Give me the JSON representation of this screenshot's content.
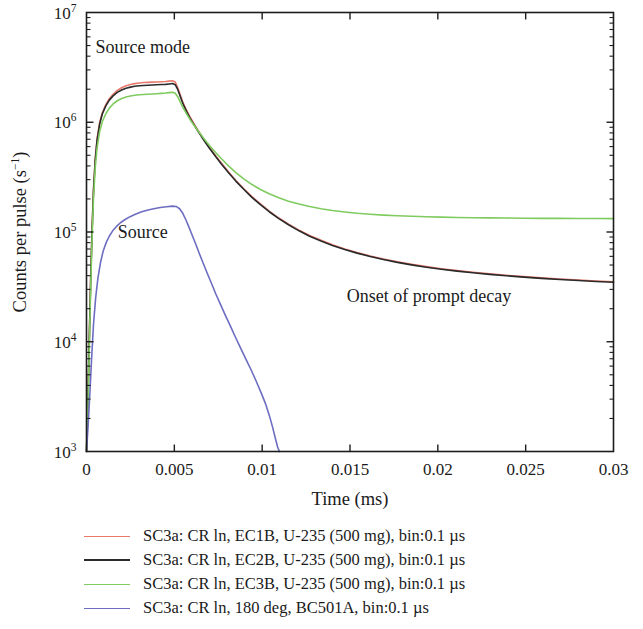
{
  "chart_data": {
    "type": "line",
    "title": "",
    "xlabel": "Time (ms)",
    "ylabel": "Counts per pulse (s−1)",
    "ylabel_parts": {
      "main": "Counts per pulse (s",
      "sup": "−1",
      "tail": ")"
    },
    "xscale": "linear",
    "yscale": "log",
    "xlim": [
      0,
      0.03
    ],
    "ylim": [
      1000,
      10000000
    ],
    "grid": false,
    "legend_position": "below-plot",
    "xticks": [
      0,
      0.005,
      0.01,
      0.015,
      0.02,
      0.025,
      0.03
    ],
    "xtick_labels": [
      "0",
      "0.005",
      "0.01",
      "0.015",
      "0.02",
      "0.025",
      "0.03"
    ],
    "yticks": [
      1000,
      10000,
      100000,
      1000000,
      10000000
    ],
    "ytick_labels": [
      "10³",
      "10⁴",
      "10⁵",
      "10⁶",
      "10⁷"
    ],
    "ytick_mantissas": [
      "10",
      "10",
      "10",
      "10",
      "10"
    ],
    "ytick_exponents": [
      "3",
      "4",
      "5",
      "6",
      "7"
    ],
    "annotations": [
      {
        "text": "Source mode",
        "x": 0.0032,
        "y": 4300000
      },
      {
        "text": "Source",
        "x": 0.0032,
        "y": 88000
      },
      {
        "text": "Onset of prompt decay",
        "x": 0.0195,
        "y": 23000
      }
    ],
    "series": [
      {
        "name": "SC3a: CR ln, EC1B, U-235 (500 mg), bin:0.1 µs",
        "color": "#e8796b",
        "points": [
          [
            0.0,
            1000
          ],
          [
            8e-05,
            3000
          ],
          [
            0.00016,
            11000
          ],
          [
            0.00024,
            40000
          ],
          [
            0.00032,
            110000
          ],
          [
            0.0004,
            250000
          ],
          [
            0.0005,
            470000
          ],
          [
            0.0006,
            700000
          ],
          [
            0.00075,
            990000
          ],
          [
            0.0009,
            1220000
          ],
          [
            0.0011,
            1450000
          ],
          [
            0.0013,
            1640000
          ],
          [
            0.0015,
            1790000
          ],
          [
            0.00175,
            1950000
          ],
          [
            0.002,
            2060000
          ],
          [
            0.00225,
            2150000
          ],
          [
            0.0025,
            2210000
          ],
          [
            0.00275,
            2250000
          ],
          [
            0.003,
            2280000
          ],
          [
            0.00325,
            2300000
          ],
          [
            0.0035,
            2310000
          ],
          [
            0.00375,
            2320000
          ],
          [
            0.004,
            2330000
          ],
          [
            0.00425,
            2340000
          ],
          [
            0.0045,
            2350000
          ],
          [
            0.0047,
            2370000
          ],
          [
            0.0049,
            2390000
          ],
          [
            0.00505,
            2330000
          ],
          [
            0.0052,
            2050000
          ],
          [
            0.00535,
            1750000
          ],
          [
            0.0055,
            1500000
          ],
          [
            0.0057,
            1280000
          ],
          [
            0.0059,
            1110000
          ],
          [
            0.00615,
            950000
          ],
          [
            0.0064,
            820000
          ],
          [
            0.0067,
            690000
          ],
          [
            0.007,
            590000
          ],
          [
            0.00735,
            495000
          ],
          [
            0.0077,
            420000
          ],
          [
            0.0081,
            350000
          ],
          [
            0.0085,
            295000
          ],
          [
            0.00895,
            248000
          ],
          [
            0.0094,
            211000
          ],
          [
            0.0099,
            180000
          ],
          [
            0.0104,
            155000
          ],
          [
            0.01095,
            134000
          ],
          [
            0.0115,
            118000
          ],
          [
            0.0121,
            104000
          ],
          [
            0.0127,
            93000
          ],
          [
            0.01335,
            84000
          ],
          [
            0.014,
            76500
          ],
          [
            0.0147,
            70000
          ],
          [
            0.0154,
            65000
          ],
          [
            0.01615,
            60500
          ],
          [
            0.0169,
            56800
          ],
          [
            0.0177,
            53500
          ],
          [
            0.0185,
            50800
          ],
          [
            0.01935,
            48400
          ],
          [
            0.0202,
            46300
          ],
          [
            0.0211,
            44500
          ],
          [
            0.022,
            43000
          ],
          [
            0.02295,
            41600
          ],
          [
            0.0239,
            40300
          ],
          [
            0.0249,
            39200
          ],
          [
            0.0259,
            38200
          ],
          [
            0.02695,
            37300
          ],
          [
            0.028,
            36500
          ],
          [
            0.029,
            35800
          ],
          [
            0.03,
            35200
          ]
        ]
      },
      {
        "name": "SC3a: CR ln, EC2B, U-235 (500 mg), bin:0.1 µs",
        "color": "#2b2b2b",
        "points": [
          [
            0.0,
            1000
          ],
          [
            8e-05,
            2800
          ],
          [
            0.00016,
            10500
          ],
          [
            0.00024,
            38000
          ],
          [
            0.00032,
            105000
          ],
          [
            0.0004,
            240000
          ],
          [
            0.0005,
            455000
          ],
          [
            0.0006,
            680000
          ],
          [
            0.00075,
            965000
          ],
          [
            0.0009,
            1190000
          ],
          [
            0.0011,
            1410000
          ],
          [
            0.0013,
            1590000
          ],
          [
            0.0015,
            1730000
          ],
          [
            0.00175,
            1870000
          ],
          [
            0.002,
            1965000
          ],
          [
            0.00225,
            2040000
          ],
          [
            0.0025,
            2090000
          ],
          [
            0.00275,
            2125000
          ],
          [
            0.003,
            2150000
          ],
          [
            0.00325,
            2165000
          ],
          [
            0.0035,
            2175000
          ],
          [
            0.00375,
            2185000
          ],
          [
            0.004,
            2195000
          ],
          [
            0.00425,
            2205000
          ],
          [
            0.0045,
            2215000
          ],
          [
            0.0047,
            2235000
          ],
          [
            0.0049,
            2255000
          ],
          [
            0.00505,
            2200000
          ],
          [
            0.0052,
            1980000
          ],
          [
            0.00535,
            1700000
          ],
          [
            0.0055,
            1460000
          ],
          [
            0.0057,
            1250000
          ],
          [
            0.0059,
            1085000
          ],
          [
            0.00615,
            930000
          ],
          [
            0.0064,
            805000
          ],
          [
            0.0067,
            678000
          ],
          [
            0.007,
            580000
          ],
          [
            0.00735,
            487000
          ],
          [
            0.0077,
            413000
          ],
          [
            0.0081,
            345000
          ],
          [
            0.0085,
            291000
          ],
          [
            0.00895,
            245000
          ],
          [
            0.0094,
            208000
          ],
          [
            0.0099,
            177500
          ],
          [
            0.0104,
            153000
          ],
          [
            0.01095,
            132500
          ],
          [
            0.0115,
            116500
          ],
          [
            0.0121,
            102500
          ],
          [
            0.0127,
            91500
          ],
          [
            0.01335,
            82800
          ],
          [
            0.014,
            75500
          ],
          [
            0.0147,
            69200
          ],
          [
            0.0154,
            64200
          ],
          [
            0.01615,
            59800
          ],
          [
            0.0169,
            56200
          ],
          [
            0.0177,
            52900
          ],
          [
            0.0185,
            50200
          ],
          [
            0.01935,
            47800
          ],
          [
            0.0202,
            45800
          ],
          [
            0.0211,
            44000
          ],
          [
            0.022,
            42500
          ],
          [
            0.02295,
            41100
          ],
          [
            0.0239,
            39900
          ],
          [
            0.0249,
            38800
          ],
          [
            0.0259,
            37800
          ],
          [
            0.02695,
            36900
          ],
          [
            0.028,
            36100
          ],
          [
            0.029,
            35400
          ],
          [
            0.03,
            34800
          ]
        ]
      },
      {
        "name": "SC3a: CR ln, EC3B, U-235 (500 mg), bin:0.1 µs",
        "color": "#7fcb5f",
        "points": [
          [
            0.0,
            1000
          ],
          [
            8e-05,
            2500
          ],
          [
            0.00016,
            9000
          ],
          [
            0.00024,
            32000
          ],
          [
            0.00032,
            90000
          ],
          [
            0.0004,
            205000
          ],
          [
            0.0005,
            390000
          ],
          [
            0.0006,
            580000
          ],
          [
            0.00075,
            825000
          ],
          [
            0.0009,
            1010000
          ],
          [
            0.0011,
            1195000
          ],
          [
            0.0013,
            1345000
          ],
          [
            0.0015,
            1460000
          ],
          [
            0.00175,
            1570000
          ],
          [
            0.002,
            1645000
          ],
          [
            0.00225,
            1700000
          ],
          [
            0.0025,
            1735000
          ],
          [
            0.00275,
            1760000
          ],
          [
            0.003,
            1778000
          ],
          [
            0.00325,
            1790000
          ],
          [
            0.0035,
            1800000
          ],
          [
            0.00375,
            1810000
          ],
          [
            0.004,
            1820000
          ],
          [
            0.00425,
            1832000
          ],
          [
            0.0045,
            1845000
          ],
          [
            0.0047,
            1862000
          ],
          [
            0.0049,
            1878000
          ],
          [
            0.00505,
            1840000
          ],
          [
            0.0052,
            1700000
          ],
          [
            0.00535,
            1520000
          ],
          [
            0.0055,
            1350000
          ],
          [
            0.0057,
            1190000
          ],
          [
            0.0059,
            1055000
          ],
          [
            0.00615,
            925000
          ],
          [
            0.0064,
            815000
          ],
          [
            0.0067,
            705000
          ],
          [
            0.007,
            615000
          ],
          [
            0.00735,
            530000
          ],
          [
            0.0077,
            462000
          ],
          [
            0.0081,
            398000
          ],
          [
            0.0085,
            348000
          ],
          [
            0.00895,
            305000
          ],
          [
            0.0094,
            272000
          ],
          [
            0.0099,
            244000
          ],
          [
            0.0104,
            223000
          ],
          [
            0.01095,
            205000
          ],
          [
            0.0115,
            191000
          ],
          [
            0.0121,
            180000
          ],
          [
            0.0127,
            171000
          ],
          [
            0.01335,
            163000
          ],
          [
            0.014,
            157000
          ],
          [
            0.0147,
            152000
          ],
          [
            0.0154,
            148000
          ],
          [
            0.01615,
            145000
          ],
          [
            0.0169,
            142500
          ],
          [
            0.0177,
            140500
          ],
          [
            0.0185,
            139000
          ],
          [
            0.01935,
            137500
          ],
          [
            0.0202,
            136500
          ],
          [
            0.0211,
            135500
          ],
          [
            0.022,
            135000
          ],
          [
            0.02295,
            134500
          ],
          [
            0.0239,
            134000
          ],
          [
            0.0249,
            133500
          ],
          [
            0.0259,
            133200
          ],
          [
            0.02695,
            133000
          ],
          [
            0.028,
            132800
          ],
          [
            0.029,
            132600
          ],
          [
            0.03,
            132500
          ]
        ]
      },
      {
        "name": "SC3a: CR ln, 180 deg, BC501A, bin:0.1 µs",
        "color": "#6d6dc2",
        "points": [
          [
            0.0,
            1000
          ],
          [
            0.0001,
            1800
          ],
          [
            0.0002,
            3600
          ],
          [
            0.0003,
            7500
          ],
          [
            0.0004,
            14500
          ],
          [
            0.00052,
            25000
          ],
          [
            0.00065,
            38000
          ],
          [
            0.0008,
            53000
          ],
          [
            0.00095,
            67000
          ],
          [
            0.00112,
            80000
          ],
          [
            0.0013,
            92000
          ],
          [
            0.0015,
            103000
          ],
          [
            0.00172,
            113000
          ],
          [
            0.00195,
            122000
          ],
          [
            0.0022,
            130000
          ],
          [
            0.00248,
            138000
          ],
          [
            0.00278,
            145000
          ],
          [
            0.0031,
            152000
          ],
          [
            0.00345,
            158000
          ],
          [
            0.00382,
            163000
          ],
          [
            0.0042,
            167000
          ],
          [
            0.00455,
            170000
          ],
          [
            0.0049,
            172000
          ],
          [
            0.0051,
            171000
          ],
          [
            0.0053,
            163000
          ],
          [
            0.00548,
            148000
          ],
          [
            0.00565,
            130000
          ],
          [
            0.00582,
            112000
          ],
          [
            0.006,
            95000
          ],
          [
            0.0062,
            79000
          ],
          [
            0.0064,
            65000
          ],
          [
            0.00662,
            53000
          ],
          [
            0.00685,
            43000
          ],
          [
            0.0071,
            34500
          ],
          [
            0.00735,
            27500
          ],
          [
            0.00762,
            22000
          ],
          [
            0.0079,
            17500
          ],
          [
            0.00818,
            14000
          ],
          [
            0.00848,
            11000
          ],
          [
            0.00878,
            8700
          ],
          [
            0.00908,
            6900
          ],
          [
            0.00938,
            5500
          ],
          [
            0.00968,
            4300
          ],
          [
            0.00995,
            3400
          ],
          [
            0.0102,
            2700
          ],
          [
            0.01042,
            2100
          ],
          [
            0.0106,
            1650
          ],
          [
            0.01075,
            1320
          ],
          [
            0.01088,
            1100
          ],
          [
            0.01098,
            1000
          ]
        ]
      }
    ]
  },
  "legend": {
    "items": [
      {
        "label": "SC3a: CR ln, EC1B, U-235 (500 mg), bin:0.1 µs",
        "color": "#e8796b"
      },
      {
        "label": "SC3a: CR ln, EC2B, U-235 (500 mg), bin:0.1 µs",
        "color": "#2b2b2b"
      },
      {
        "label": "SC3a: CR ln, EC3B, U-235 (500 mg), bin:0.1 µs",
        "color": "#7fcb5f"
      },
      {
        "label": "SC3a: CR ln, 180 deg, BC501A, bin:0.1 µs",
        "color": "#6d6dc2"
      }
    ]
  }
}
